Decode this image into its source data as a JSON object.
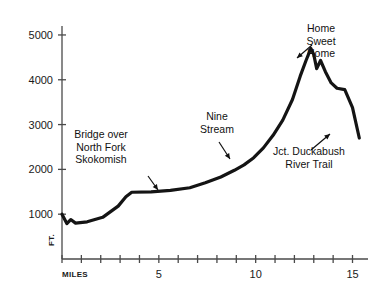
{
  "chart_data": {
    "type": "line",
    "title": "",
    "xlabel": "MILES",
    "ylabel": "FT.",
    "xlim": [
      0,
      15.8
    ],
    "ylim": [
      0,
      5200
    ],
    "grid": false,
    "legend": "none",
    "x_tick_values": [
      0,
      1,
      2,
      3,
      4,
      5,
      6,
      7,
      8,
      9,
      10,
      11,
      12,
      13,
      14,
      15
    ],
    "x_tick_labels": [
      "",
      "",
      "",
      "",
      "",
      "5",
      "",
      "",
      "",
      "",
      "10",
      "",
      "",
      "",
      "",
      "15"
    ],
    "y_tick_values": [
      1000,
      2000,
      3000,
      4000,
      5000
    ],
    "y_tick_labels": [
      "1000",
      "2000",
      "3000",
      "4000",
      "5000"
    ],
    "series": [
      {
        "name": "Elevation profile",
        "x": [
          0.0,
          0.25,
          0.45,
          0.7,
          1.3,
          2.1,
          2.9,
          3.3,
          3.6,
          4.6,
          5.6,
          6.6,
          7.4,
          8.2,
          8.9,
          9.4,
          9.9,
          10.4,
          10.9,
          11.4,
          11.9,
          12.3,
          12.6,
          12.85,
          13.0,
          13.15,
          13.35,
          13.6,
          13.9,
          14.2,
          14.6,
          15.0,
          15.35
        ],
        "y": [
          1000,
          790,
          880,
          800,
          830,
          930,
          1180,
          1390,
          1490,
          1500,
          1530,
          1590,
          1700,
          1830,
          1980,
          2100,
          2260,
          2480,
          2760,
          3100,
          3560,
          4080,
          4430,
          4700,
          4560,
          4250,
          4430,
          4180,
          3930,
          3810,
          3780,
          3380,
          2700
        ]
      }
    ]
  },
  "axis": {
    "y_unit_label": "FT.",
    "x_unit_label": "MILES"
  },
  "annotations": [
    {
      "name": "bridge-over-north-fork-skokomish",
      "lines": [
        "Bridge over",
        "North Fork",
        "Skokomish"
      ],
      "text_x": 101,
      "text_y": 138,
      "align": "middle",
      "arrow": {
        "x1": 148,
        "y1": 176,
        "x2": 158,
        "y2": 190
      }
    },
    {
      "name": "nine-stream",
      "lines": [
        "Nine",
        "Stream"
      ],
      "text_x": 217,
      "text_y": 120,
      "align": "middle",
      "arrow": {
        "x1": 219,
        "y1": 142,
        "x2": 230,
        "y2": 159
      }
    },
    {
      "name": "home-sweet-home",
      "lines": [
        "Home",
        "Sweet",
        "Home"
      ],
      "text_x": 321,
      "text_y": 32,
      "align": "middle",
      "arrow": {
        "x1": 312,
        "y1": 45,
        "x2": 297,
        "y2": 58
      }
    },
    {
      "name": "jct-duckabush-river-trail",
      "lines": [
        "Jct. Duckabush",
        "River Trail"
      ],
      "text_x": 309,
      "text_y": 155,
      "align": "middle",
      "arrow": {
        "x1": 311,
        "y1": 150,
        "x2": 330,
        "y2": 134
      }
    }
  ],
  "style": {
    "line_color": "#141414",
    "axis_color": "#4a4a4a",
    "text_color": "#111111",
    "background": "#ffffff",
    "line_width": 3.2
  }
}
